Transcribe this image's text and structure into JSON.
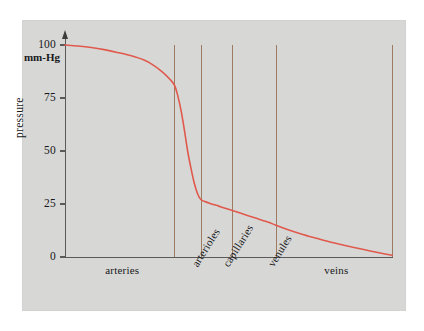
{
  "figure": {
    "panel_background": "#d7d8d6",
    "page_background": "#ffffff",
    "curve_color": "#e0594d",
    "divider_color": "#9d7b63",
    "axis_color": "#5a5a58"
  },
  "axes": {
    "y_unit_label": "mm-Hg",
    "y_axis_title": "pressure",
    "y_ticks": [
      {
        "value": 100,
        "label": "100"
      },
      {
        "value": 75,
        "label": "75"
      },
      {
        "value": 50,
        "label": "50"
      },
      {
        "value": 25,
        "label": "25"
      },
      {
        "value": 0,
        "label": "0"
      }
    ]
  },
  "segments": [
    {
      "name": "arteries",
      "label": "arteries",
      "orientation": "horizontal",
      "center_fraction": 0.175
    },
    {
      "name": "arterioles",
      "label": "arterioles",
      "orientation": "rotated",
      "center_fraction": 0.383
    },
    {
      "name": "capillaries",
      "label": "capillaries",
      "orientation": "rotated",
      "center_fraction": 0.478
    },
    {
      "name": "venules",
      "label": "venules",
      "orientation": "rotated",
      "center_fraction": 0.616
    },
    {
      "name": "veins",
      "label": "veins",
      "orientation": "horizontal",
      "center_fraction": 0.83
    }
  ],
  "dividers": [
    {
      "name": "arteries-arterioles-divider",
      "x_fraction": 0.333
    },
    {
      "name": "arterioles-capillaries-divider",
      "x_fraction": 0.416
    },
    {
      "name": "capillaries-venules-divider",
      "x_fraction": 0.511
    },
    {
      "name": "venules-veins-divider",
      "x_fraction": 0.645
    },
    {
      "name": "veins-end-divider",
      "x_fraction": 1.0
    }
  ],
  "chart_data": {
    "type": "line",
    "title": "",
    "subtitle": "",
    "xlabel": "",
    "ylabel": "pressure",
    "y_unit": "mm-Hg",
    "xlim": [
      0,
      1
    ],
    "ylim": [
      0,
      100
    ],
    "grid": false,
    "legend": "none",
    "x_categories": [
      "arteries",
      "arterioles",
      "capillaries",
      "venules",
      "veins"
    ],
    "x_tick_labels": [],
    "y_tick_labels": [
      "0",
      "25",
      "50",
      "75",
      "100"
    ],
    "annotations": [
      "mm-Hg"
    ],
    "series": [
      {
        "name": "blood pressure",
        "color": "#e0594d",
        "x": [
          0.0,
          0.04,
          0.08,
          0.12,
          0.16,
          0.2,
          0.24,
          0.27,
          0.3,
          0.32,
          0.335,
          0.345,
          0.355,
          0.365,
          0.375,
          0.385,
          0.395,
          0.405,
          0.416,
          0.44,
          0.47,
          0.5,
          0.54,
          0.58,
          0.62,
          0.645,
          0.68,
          0.72,
          0.76,
          0.8,
          0.84,
          0.88,
          0.92,
          0.96,
          1.0
        ],
        "y": [
          100,
          99.5,
          98.8,
          97.8,
          96.5,
          95,
          93,
          90.5,
          87,
          84,
          81,
          76,
          69,
          60,
          50,
          42,
          35,
          30,
          27,
          25.5,
          24,
          22.5,
          20.5,
          18.5,
          16.5,
          15,
          13,
          11,
          9.2,
          7.5,
          6,
          4.6,
          3.3,
          2.0,
          0.8
        ]
      }
    ]
  }
}
